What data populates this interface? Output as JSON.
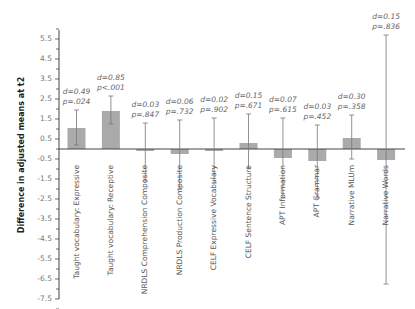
{
  "chart_data": {
    "type": "bar",
    "title": "",
    "xlabel": "",
    "ylabel": "Difference in adjusted means at t2",
    "ylim": [
      -7.5,
      5.5
    ],
    "yticks": [
      5.5,
      4.5,
      3.5,
      2.5,
      1.5,
      0.5,
      -0.5,
      -1.5,
      -2.5,
      -3.5,
      -4.5,
      -5.5,
      -6.5,
      -7.5
    ],
    "grid": false,
    "legend": null,
    "error_bars": true,
    "categories": [
      "Taught vocabulary: Expressive",
      "Taught vocabulary: Receptive",
      "NRDLS Comprehension Composite",
      "NRDLS Production Composite",
      "CELF Expressive Vocabulary",
      "CELF Sentence Structure",
      "APT Information",
      "APT Grammar",
      "Narrative MLUm",
      "Narrative Words"
    ],
    "values": [
      1.05,
      1.9,
      -0.1,
      -0.25,
      -0.1,
      0.3,
      -0.45,
      -0.6,
      0.55,
      -0.55
    ],
    "error_low": [
      0.2,
      1.25,
      -1.6,
      -2.0,
      -1.7,
      -0.95,
      -2.45,
      -2.45,
      -0.5,
      -6.75
    ],
    "error_high": [
      1.95,
      2.65,
      1.3,
      1.45,
      1.55,
      1.75,
      1.55,
      1.2,
      1.7,
      5.7
    ],
    "annotations": [
      {
        "d": "d=0.49",
        "p": "p=.024"
      },
      {
        "d": "d=0.85",
        "p": "p<.001"
      },
      {
        "d": "d=0.03",
        "p": "p=.847"
      },
      {
        "d": "d=0.06",
        "p": "p=.732"
      },
      {
        "d": "d=0.02",
        "p": "p=.902"
      },
      {
        "d": "d=0.15",
        "p": "p=.671"
      },
      {
        "d": "d=0.07",
        "p": "p=.615"
      },
      {
        "d": "d=0.03",
        "p": "p=.452"
      },
      {
        "d": "d=0.30",
        "p": "p=.358"
      },
      {
        "d": "d=0.15",
        "p": "p=.836"
      }
    ],
    "colors": {
      "bar": "#aaaaaa",
      "error": "#777777",
      "axis": "#444444"
    }
  }
}
